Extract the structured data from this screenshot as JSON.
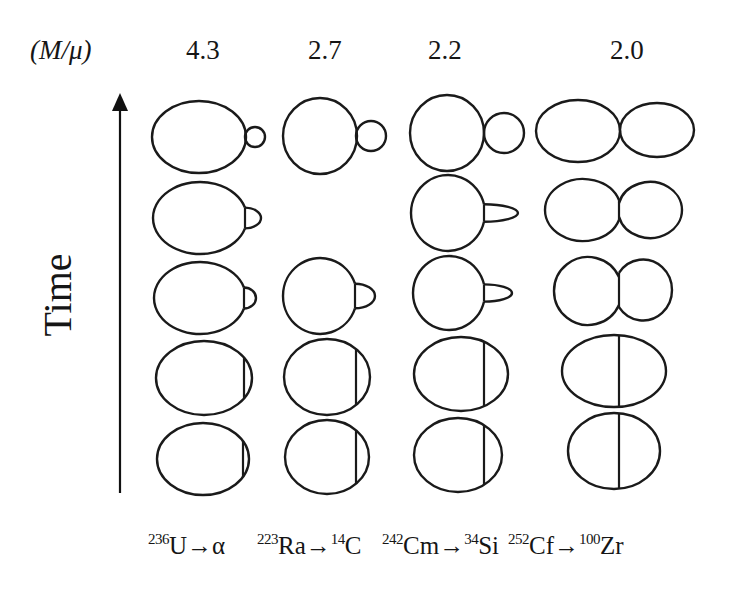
{
  "header": {
    "ratio_label": "(M/μ)",
    "ratios": [
      "4.3",
      "2.7",
      "2.2",
      "2.0"
    ]
  },
  "axis": {
    "label": "Time",
    "direction": "up"
  },
  "columns": [
    {
      "id": "u236",
      "ratio": "4.3",
      "parent_mass": "236",
      "parent": "U",
      "arrow": "→",
      "fragment_mass": "",
      "fragment": "α",
      "stages": [
        {
          "type": "separated",
          "big": {
            "cx": 199,
            "cy": 137,
            "rx": 47,
            "ry": 36
          },
          "small": {
            "cx": 255,
            "cy": 137,
            "r": 10
          }
        },
        {
          "type": "bump",
          "big": {
            "cx": 200,
            "cy": 218,
            "rx": 47,
            "ry": 36
          },
          "neck_x": 245,
          "bump_right": 261
        },
        {
          "type": "bump",
          "big": {
            "cx": 200,
            "cy": 298,
            "rx": 46,
            "ry": 36
          },
          "neck_x": 244,
          "bump_right": 256
        },
        {
          "type": "chord",
          "big": {
            "cx": 204,
            "cy": 378,
            "rx": 48,
            "ry": 37
          },
          "neck_x": 244
        },
        {
          "type": "chord",
          "big": {
            "cx": 203,
            "cy": 459,
            "rx": 46,
            "ry": 36
          },
          "neck_x": 243
        }
      ]
    },
    {
      "id": "ra223",
      "ratio": "2.7",
      "parent_mass": "223",
      "parent": "Ra",
      "arrow": "→",
      "fragment_mass": "14",
      "fragment": "C",
      "stages": [
        {
          "type": "separated",
          "big": {
            "cx": 320,
            "cy": 136,
            "rx": 37,
            "ry": 38
          },
          "small": {
            "cx": 371,
            "cy": 136,
            "r": 15
          }
        },
        {
          "type": "bump",
          "big": {
            "cx": 319,
            "cy": 216,
            "rx": 37,
            "ry": 38
          },
          "neck_x": 356,
          "bump_right": 380
        },
        {
          "type": "bump",
          "big": {
            "cx": 320,
            "cy": 296,
            "rx": 37,
            "ry": 38
          },
          "neck_x": 355,
          "bump_right": 375
        },
        {
          "type": "chord",
          "big": {
            "cx": 327,
            "cy": 377,
            "rx": 43,
            "ry": 38
          },
          "neck_x": 356
        },
        {
          "type": "chord",
          "big": {
            "cx": 327,
            "cy": 457,
            "rx": 42,
            "ry": 37
          },
          "neck_x": 356
        }
      ]
    },
    {
      "id": "cm242",
      "ratio": "2.2",
      "parent_mass": "242",
      "parent": "Cm",
      "arrow": "→",
      "fragment_mass": "34",
      "fragment": "Si",
      "stages": [
        {
          "type": "separated",
          "big": {
            "cx": 447,
            "cy": 133,
            "rx": 37,
            "ry": 38
          },
          "small": {
            "cx": 504,
            "cy": 133,
            "r": 20
          }
        },
        {
          "type": "bump",
          "big": {
            "cx": 448,
            "cy": 213,
            "rx": 37,
            "ry": 38
          },
          "neck_x": 484,
          "bump_right": 518
        },
        {
          "type": "bump",
          "big": {
            "cx": 449,
            "cy": 293,
            "rx": 36,
            "ry": 37
          },
          "neck_x": 484,
          "bump_right": 512
        },
        {
          "type": "chord",
          "big": {
            "cx": 461,
            "cy": 374,
            "rx": 47,
            "ry": 37
          },
          "neck_x": 484
        },
        {
          "type": "chord",
          "big": {
            "cx": 458,
            "cy": 455,
            "rx": 44,
            "ry": 37
          },
          "neck_x": 484
        }
      ]
    },
    {
      "id": "cf252",
      "ratio": "2.0",
      "parent_mass": "252",
      "parent": "Cf",
      "arrow": "→",
      "fragment_mass": "100",
      "fragment": "Zr",
      "stages": [
        {
          "type": "twin",
          "left": {
            "cx": 578,
            "cy": 131,
            "rx": 42,
            "ry": 31
          },
          "right": {
            "cx": 657,
            "cy": 130,
            "rx": 37,
            "ry": 27
          },
          "neck_x": 620,
          "neck_half": 0
        },
        {
          "type": "twin",
          "left": {
            "cx": 583,
            "cy": 210,
            "rx": 38,
            "ry": 31
          },
          "right": {
            "cx": 650,
            "cy": 210,
            "rx": 32,
            "ry": 28
          },
          "neck_x": 619,
          "neck_half": 22
        },
        {
          "type": "twin",
          "left": {
            "cx": 588,
            "cy": 291,
            "rx": 34,
            "ry": 34
          },
          "right": {
            "cx": 643,
            "cy": 290,
            "rx": 29,
            "ry": 30.5
          },
          "neck_x": 619,
          "neck_half": 30
        },
        {
          "type": "chord",
          "big": {
            "cx": 614,
            "cy": 371,
            "rx": 52,
            "ry": 36
          },
          "neck_x": 619
        },
        {
          "type": "chord",
          "big": {
            "cx": 614,
            "cy": 451,
            "rx": 46,
            "ry": 38
          },
          "neck_x": 619
        }
      ]
    }
  ],
  "layout": {
    "ratio_title_pos": {
      "x": 30,
      "y": 37
    },
    "ratio_x": [
      186,
      308,
      428,
      610
    ],
    "decay_x": [
      148,
      257,
      382,
      508
    ],
    "arrow": {
      "x": 120,
      "y_top": 95,
      "y_bottom": 493
    }
  }
}
